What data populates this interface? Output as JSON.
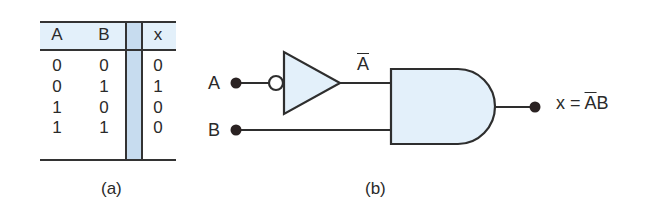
{
  "truth_table": {
    "headers": [
      "A",
      "B",
      "x"
    ],
    "rows": [
      [
        "0",
        "0",
        "0"
      ],
      [
        "0",
        "1",
        "1"
      ],
      [
        "1",
        "0",
        "0"
      ],
      [
        "1",
        "1",
        "0"
      ]
    ],
    "caption": "(a)"
  },
  "circuit": {
    "input_a_label": "A",
    "input_b_label": "B",
    "inverter_output_label": "A",
    "output_label_prefix": "x = ",
    "output_label_bar": "A",
    "output_label_suffix": "B",
    "caption": "(b)",
    "colors": {
      "gate_fill": "#e3f0fa",
      "stroke": "#2e2e2e",
      "bar_fill": "#c7dcef"
    }
  }
}
